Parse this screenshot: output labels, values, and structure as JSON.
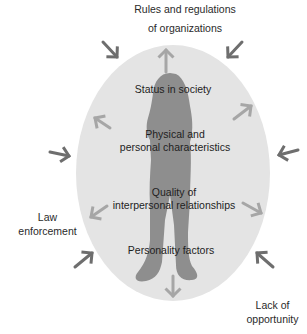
{
  "external_factors": {
    "top": "Rules and regulations\nof organizations",
    "left": "Law\nenforcement",
    "bottom_right": "Lack of\nopportunity"
  },
  "internal_factors": [
    "Status in society",
    "Physical and\npersonal characteristics",
    "Quality of\ninterpersonal relationships",
    "Personality factors"
  ],
  "colors": {
    "ellipse_fill": "#e4e4e4",
    "silhouette": "#8e8e8e",
    "inward_arrow": "#6e6e6e",
    "outward_arrow": "#a6a6a6"
  }
}
